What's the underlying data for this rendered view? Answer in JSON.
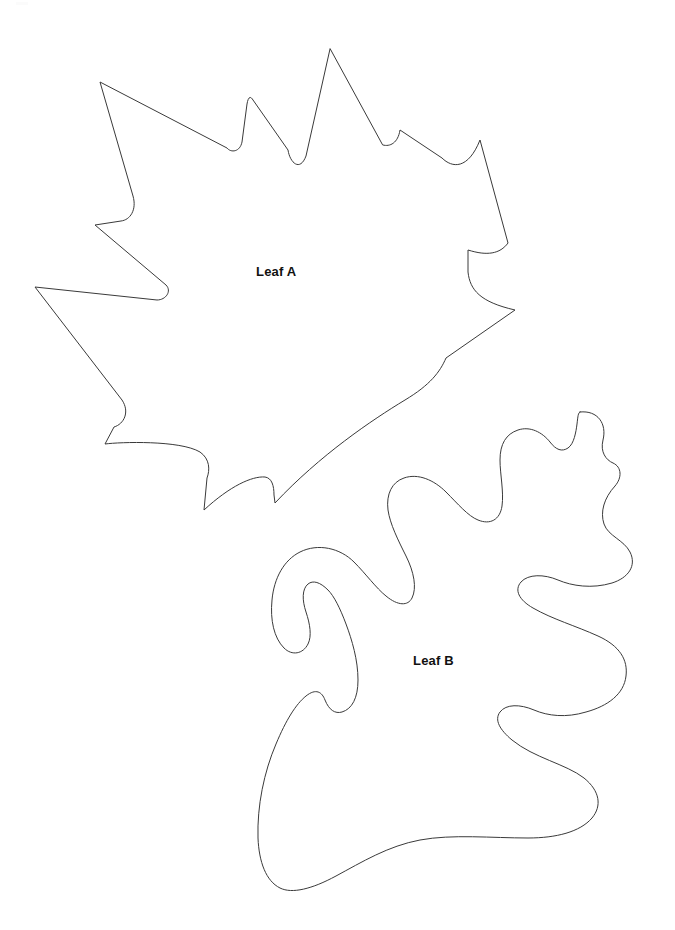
{
  "page": {
    "background_color": "#ffffff",
    "width": 675,
    "height": 930
  },
  "style": {
    "stroke_color": "#3a3a3a",
    "fill_color": "#ffffff",
    "stroke_width": 1,
    "label_color": "#111111",
    "label_font_size": 13,
    "label_font_weight": "bold"
  },
  "figures": [
    {
      "id": "leaf-a",
      "label": "Leaf A",
      "shape_type": "maple-leaf-outline",
      "label_position": {
        "x": 256,
        "y": 264
      },
      "bounds": {
        "x": 35,
        "y": 48,
        "width": 481,
        "height": 467
      },
      "path": "M 330 49 L 306 156 C 300 172 290 163 288 150 L 253 100 C 250 95 248 98 247 104 L 242 142 C 240 152 231 153 227 148 L 100 82 L 133 196 C 137 210 130 220 121 221 L 95 225 L 166 285 C 172 291 166 300 157 300 L 35 287 L 122 400 C 130 412 124 424 114 427 L 105 444 C 120 442 180 440 200 452 C 210 459 210 470 207 478 L 204 510 C 230 486 252 476 265 477 C 272 478 274 486 274 495 L 275 503 C 320 455 372 420 405 400 C 430 385 440 372 446 358 L 515 310 C 480 302 470 290 468 272 L 468 250 C 487 256 500 254 508 243 L 480 140 C 468 170 452 168 442 158 L 400 130 C 398 143 390 147 383 145 Z"
    },
    {
      "id": "leaf-b",
      "label": "Leaf B",
      "shape_type": "oak-leaf-outline",
      "label_position": {
        "x": 413,
        "y": 653
      },
      "bounds": {
        "x": 258,
        "y": 410,
        "width": 374,
        "height": 485
      },
      "path": "M 580 412 C 598 410 607 424 603 440 C 600 452 606 460 613 463 C 622 467 622 478 615 486 C 604 498 600 512 604 524 C 608 536 624 540 630 552 C 637 566 628 578 612 583 C 592 589 572 586 558 580 C 544 574 528 574 521 582 C 514 590 519 600 533 608 C 552 619 576 626 598 636 C 620 646 628 660 626 676 C 624 694 608 706 586 712 C 566 718 548 716 534 710 C 520 704 506 704 500 712 C 494 720 500 730 512 740 C 534 758 566 764 584 778 C 600 791 602 806 592 818 C 580 832 556 838 528 838 C 492 838 452 834 420 840 C 388 846 362 862 336 876 C 312 889 292 894 280 888 C 266 881 259 862 258 838 C 257 806 264 772 276 744 C 286 720 296 704 306 696 C 316 688 322 692 325 700 C 329 710 335 714 342 712 C 352 709 358 698 358 680 C 358 660 352 640 346 624 C 340 608 334 596 328 590 C 320 582 313 580 308 584 C 302 589 302 600 306 612 C 310 624 312 636 308 644 C 303 654 292 656 284 648 C 274 638 270 620 272 600 C 274 578 284 560 300 552 C 318 543 340 548 354 562 C 366 574 376 588 386 596 C 398 606 408 606 412 598 C 417 588 414 572 406 556 C 398 540 390 524 388 510 C 386 494 392 482 404 478 C 418 473 434 480 446 492 C 458 504 468 516 478 520 C 490 525 500 520 502 506 C 504 492 500 474 500 460 C 500 444 506 434 518 430 C 530 426 542 432 550 442 C 556 450 562 452 568 448 C 574 444 576 432 577 424 C 578 416 578 413 580 412 Z"
    }
  ]
}
